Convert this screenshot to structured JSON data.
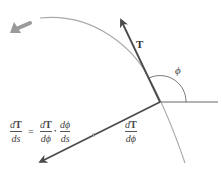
{
  "diagram": {
    "title": "",
    "labels": {
      "tangent_vector": "T",
      "angle": "ϕ",
      "derivative_vector_num_d": "d",
      "derivative_vector_num_T": "T",
      "derivative_vector_den": "dϕ"
    },
    "formula": {
      "lhs_num_d": "d",
      "lhs_num_T": "T",
      "lhs_den": "ds",
      "equals": "=",
      "term1_num_d": "d",
      "term1_num_T": "T",
      "term1_den": "dϕ",
      "dot": "•",
      "term2_num": "dϕ",
      "term2_den": "ds"
    },
    "colors": {
      "curve": "#a8a8a8",
      "vectors": "#4a4a4a",
      "reference_line": "#555555",
      "direction_arrow": "#9a9a9a",
      "text": "#333333"
    },
    "geometry": {
      "point": [
        160,
        102
      ],
      "tangent_tip": [
        120,
        18
      ],
      "derivative_tip": [
        38,
        163
      ],
      "horizontal_end": [
        218,
        102
      ],
      "angle_arc_radius": 26
    }
  }
}
